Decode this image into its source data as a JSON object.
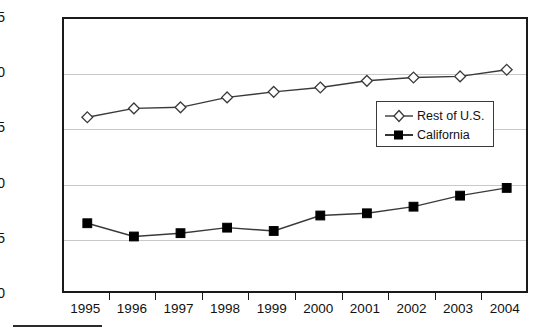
{
  "chart_data": {
    "type": "line",
    "title": "",
    "subtitle": "",
    "xlabel": "",
    "ylabel": "Percentage",
    "categories": [
      "1995",
      "1996",
      "1997",
      "1998",
      "1999",
      "2000",
      "2001",
      "2002",
      "2003",
      "2004"
    ],
    "x": [
      1995,
      1996,
      1997,
      1998,
      1999,
      2000,
      2001,
      2002,
      2003,
      2004
    ],
    "ylim": [
      50,
      75
    ],
    "yticks": [
      50,
      55,
      60,
      65,
      70,
      75
    ],
    "ytick_labels": [
      "50",
      "55",
      "60",
      "65",
      "70",
      "75"
    ],
    "grid": true,
    "grid_axis": "y",
    "legend_position": "center-right",
    "series": [
      {
        "name": "Rest of U.S.",
        "marker": "open-diamond",
        "color": "#3a3a3a",
        "values": [
          66.1,
          66.9,
          67.0,
          67.9,
          68.4,
          68.8,
          69.4,
          69.7,
          69.8,
          70.4
        ]
      },
      {
        "name": "California",
        "marker": "filled-square",
        "color": "#000000",
        "values": [
          56.5,
          55.3,
          55.6,
          56.1,
          55.8,
          57.2,
          57.4,
          58.0,
          59.0,
          59.7
        ]
      }
    ]
  },
  "legend": {
    "entries": [
      {
        "label": "Rest of U.S."
      },
      {
        "label": "California"
      }
    ]
  },
  "colors": {
    "axis": "#1a1a1a",
    "gridline": "#c9c9c9",
    "series_rest_of_us": "#3a3a3a",
    "series_california": "#000000",
    "background": "#ffffff",
    "text": "#111111"
  }
}
